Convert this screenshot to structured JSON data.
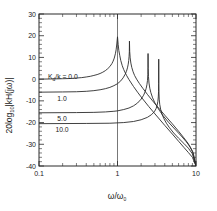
{
  "figure": {
    "background": "#ffffff",
    "axis_color": "#2b2b2b",
    "curve_color": "#2b2b2b"
  },
  "labels": {
    "ylabel_prefix": "20log",
    "ylabel_sub": "10",
    "ylabel_body": "kH(jω)",
    "xlabel": "ω/ω",
    "xlabel_sub": "0",
    "legend_prefix": "K",
    "legend_sub": "d",
    "legend_rest": "/k = "
  },
  "chart_data": {
    "type": "line",
    "title": "",
    "xlabel": "ω/ω₀",
    "ylabel": "20log₁₀|kH(jω)|",
    "xscale": "log",
    "xlim": [
      0.1,
      10
    ],
    "ylim": [
      -40,
      30
    ],
    "yticks": [
      30,
      20,
      10,
      0,
      -10,
      -20,
      -30,
      -40
    ],
    "ytick_labels": [
      "30",
      "20",
      "10",
      "0",
      "-10",
      "-20",
      "-30",
      "-40"
    ],
    "xticks": [
      0.1,
      1,
      10
    ],
    "xtick_labels": [
      "0.1",
      "1",
      "10"
    ],
    "grid": "vertical line at x = 1",
    "legend_position": "inline labels on curves",
    "series": [
      {
        "name": "0.0",
        "label": "K_d/k = 0.0",
        "low_freq_value": 0.0,
        "peak_x": 1.0,
        "peak_y": 19.5,
        "end_x": 10,
        "end_y": -40,
        "points": [
          [
            0.1,
            0.0
          ],
          [
            0.15,
            0.1
          ],
          [
            0.2,
            0.2
          ],
          [
            0.25,
            0.3
          ],
          [
            0.3,
            0.5
          ],
          [
            0.35,
            0.7
          ],
          [
            0.4,
            1.0
          ],
          [
            0.45,
            1.3
          ],
          [
            0.5,
            1.7
          ],
          [
            0.55,
            2.1
          ],
          [
            0.6,
            2.6
          ],
          [
            0.65,
            3.2
          ],
          [
            0.7,
            3.9
          ],
          [
            0.75,
            4.8
          ],
          [
            0.8,
            5.8
          ],
          [
            0.85,
            7.2
          ],
          [
            0.88,
            8.3
          ],
          [
            0.91,
            9.7
          ],
          [
            0.94,
            11.7
          ],
          [
            0.96,
            13.5
          ],
          [
            0.98,
            16.2
          ],
          [
            1.0,
            19.5
          ],
          [
            1.02,
            16.0
          ],
          [
            1.04,
            13.2
          ],
          [
            1.07,
            10.8
          ],
          [
            1.1,
            8.6
          ],
          [
            1.15,
            6.2
          ],
          [
            1.2,
            4.4
          ],
          [
            1.3,
            1.8
          ],
          [
            1.4,
            -0.2
          ],
          [
            1.6,
            -3.4
          ],
          [
            1.8,
            -6.0
          ],
          [
            2.0,
            -8.2
          ],
          [
            2.5,
            -12.6
          ],
          [
            3.0,
            -16.0
          ],
          [
            4.0,
            -21.3
          ],
          [
            5.0,
            -25.3
          ],
          [
            6.0,
            -28.6
          ],
          [
            7.0,
            -31.4
          ],
          [
            8.0,
            -33.8
          ],
          [
            9.0,
            -36.0
          ],
          [
            10.0,
            -40.0
          ]
        ]
      },
      {
        "name": "1.0",
        "label": "1.0",
        "low_freq_value": -6.0,
        "peak_x": 1.42,
        "peak_y": 17.5,
        "end_x": 10,
        "end_y": -40,
        "points": [
          [
            0.1,
            -6.0
          ],
          [
            0.2,
            -5.9
          ],
          [
            0.3,
            -5.8
          ],
          [
            0.4,
            -5.6
          ],
          [
            0.5,
            -5.3
          ],
          [
            0.6,
            -4.9
          ],
          [
            0.7,
            -4.4
          ],
          [
            0.8,
            -3.8
          ],
          [
            0.9,
            -3.0
          ],
          [
            1.0,
            -2.1
          ],
          [
            1.1,
            -0.8
          ],
          [
            1.18,
            0.6
          ],
          [
            1.25,
            2.2
          ],
          [
            1.3,
            3.6
          ],
          [
            1.34,
            5.2
          ],
          [
            1.37,
            6.9
          ],
          [
            1.39,
            8.6
          ],
          [
            1.405,
            10.5
          ],
          [
            1.415,
            12.6
          ],
          [
            1.42,
            17.5
          ],
          [
            1.43,
            12.8
          ],
          [
            1.45,
            9.8
          ],
          [
            1.48,
            7.4
          ],
          [
            1.52,
            5.4
          ],
          [
            1.58,
            3.4
          ],
          [
            1.65,
            1.7
          ],
          [
            1.75,
            0.0
          ],
          [
            1.9,
            -2.0
          ],
          [
            2.1,
            -4.2
          ],
          [
            2.4,
            -7.0
          ],
          [
            2.8,
            -10.0
          ],
          [
            3.2,
            -12.5
          ],
          [
            4.0,
            -16.6
          ],
          [
            5.0,
            -20.6
          ],
          [
            6.0,
            -24.0
          ],
          [
            7.0,
            -27.0
          ],
          [
            8.0,
            -29.8
          ],
          [
            9.0,
            -33.4
          ],
          [
            10.0,
            -40.0
          ]
        ]
      },
      {
        "name": "5.0",
        "label": "5.0",
        "low_freq_value": -15.5,
        "peak_x": 2.45,
        "peak_y": 11.8,
        "end_x": 10,
        "end_y": -40,
        "points": [
          [
            0.1,
            -15.5
          ],
          [
            0.3,
            -15.4
          ],
          [
            0.5,
            -15.3
          ],
          [
            0.7,
            -15.1
          ],
          [
            0.9,
            -14.8
          ],
          [
            1.0,
            -14.6
          ],
          [
            1.2,
            -14.0
          ],
          [
            1.4,
            -13.3
          ],
          [
            1.6,
            -12.3
          ],
          [
            1.8,
            -11.0
          ],
          [
            2.0,
            -9.2
          ],
          [
            2.15,
            -7.4
          ],
          [
            2.25,
            -5.8
          ],
          [
            2.32,
            -4.2
          ],
          [
            2.37,
            -2.6
          ],
          [
            2.41,
            -0.6
          ],
          [
            2.435,
            2.0
          ],
          [
            2.445,
            5.5
          ],
          [
            2.45,
            11.8
          ],
          [
            2.46,
            5.0
          ],
          [
            2.48,
            1.2
          ],
          [
            2.52,
            -1.8
          ],
          [
            2.58,
            -4.2
          ],
          [
            2.66,
            -6.2
          ],
          [
            2.8,
            -8.6
          ],
          [
            3.0,
            -11.0
          ],
          [
            3.4,
            -14.3
          ],
          [
            3.8,
            -16.8
          ],
          [
            4.5,
            -20.0
          ],
          [
            5.5,
            -23.4
          ],
          [
            6.5,
            -26.2
          ],
          [
            7.5,
            -28.8
          ],
          [
            8.5,
            -31.4
          ],
          [
            9.2,
            -33.8
          ],
          [
            10.0,
            -40.0
          ]
        ]
      },
      {
        "name": "10.0",
        "label": "10.0",
        "low_freq_value": -20.5,
        "peak_x": 3.35,
        "peak_y": 9.2,
        "end_x": 10,
        "end_y": -40,
        "points": [
          [
            0.1,
            -20.5
          ],
          [
            0.4,
            -20.4
          ],
          [
            0.8,
            -20.3
          ],
          [
            1.2,
            -20.0
          ],
          [
            1.6,
            -19.5
          ],
          [
            2.0,
            -18.7
          ],
          [
            2.4,
            -17.6
          ],
          [
            2.7,
            -16.4
          ],
          [
            2.95,
            -15.0
          ],
          [
            3.1,
            -13.6
          ],
          [
            3.2,
            -12.0
          ],
          [
            3.27,
            -10.2
          ],
          [
            3.31,
            -8.2
          ],
          [
            3.335,
            -5.6
          ],
          [
            3.345,
            -2.0
          ],
          [
            3.35,
            9.2
          ],
          [
            3.36,
            -2.6
          ],
          [
            3.375,
            -6.4
          ],
          [
            3.4,
            -9.2
          ],
          [
            3.45,
            -11.6
          ],
          [
            3.55,
            -14.0
          ],
          [
            3.7,
            -16.2
          ],
          [
            3.9,
            -18.2
          ],
          [
            4.2,
            -20.3
          ],
          [
            4.6,
            -22.4
          ],
          [
            5.2,
            -24.8
          ],
          [
            6.0,
            -27.2
          ],
          [
            7.0,
            -29.6
          ],
          [
            8.0,
            -31.8
          ],
          [
            9.0,
            -34.4
          ],
          [
            10.0,
            -40.0
          ]
        ]
      }
    ],
    "curve_label_values": [
      "0.0",
      "1.0",
      "5.0",
      "10.0"
    ]
  }
}
